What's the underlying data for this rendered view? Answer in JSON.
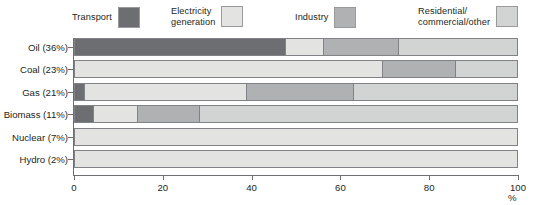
{
  "legend": {
    "items": [
      {
        "label": "Transport",
        "key": "transport",
        "color": "#6d6e71"
      },
      {
        "label": "Electricity\ngeneration",
        "key": "electricity",
        "color": "#e3e3e2"
      },
      {
        "label": "Industry",
        "key": "industry",
        "color": "#b0b1b2"
      },
      {
        "label": "Residential/\ncommercial/other",
        "key": "residential",
        "color": "#d2d3d3"
      }
    ]
  },
  "axis": {
    "x_ticks": [
      "0",
      "20",
      "40",
      "60",
      "80",
      "100"
    ],
    "x_unit": "%",
    "y_categories": [
      "Oil (36%)",
      "Coal (23%)",
      "Gas (21%)",
      "Biomass (11%)",
      "Nuclear (7%)",
      "Hydro (2%)"
    ]
  },
  "chart_data": {
    "type": "bar",
    "orientation": "horizontal",
    "stacked": true,
    "title": "",
    "xlabel": "%",
    "ylabel": "",
    "xlim": [
      0,
      100
    ],
    "grid": false,
    "legend_position": "top",
    "categories": [
      "Oil (36%)",
      "Coal (23%)",
      "Gas (21%)",
      "Biomass (11%)",
      "Nuclear (7%)",
      "Hydro (2%)"
    ],
    "series": [
      {
        "name": "Transport",
        "color": "#6d6e71",
        "values": [
          47.5,
          0,
          2,
          4,
          0,
          0
        ]
      },
      {
        "name": "Electricity generation",
        "color": "#e3e3e2",
        "values": [
          8.5,
          69.5,
          36.7,
          10,
          100,
          100
        ]
      },
      {
        "name": "Industry",
        "color": "#b0b1b2",
        "values": [
          17,
          16.5,
          24.1,
          14,
          0,
          0
        ]
      },
      {
        "name": "Residential/commercial/other",
        "color": "#d2d3d3",
        "values": [
          27,
          14,
          37.2,
          72,
          0,
          0
        ]
      }
    ],
    "rows": [
      {
        "category": "Oil (36%)",
        "segments": [
          {
            "series": "Transport",
            "value": 47.5,
            "color": "#6d6e71"
          },
          {
            "series": "Electricity generation",
            "value": 8.5,
            "color": "#e3e3e2"
          },
          {
            "series": "Industry",
            "value": 17,
            "color": "#b0b1b2"
          },
          {
            "series": "Residential/commercial/other",
            "value": 27,
            "color": "#d2d3d3"
          }
        ]
      },
      {
        "category": "Coal (23%)",
        "segments": [
          {
            "series": "Electricity generation",
            "value": 69.5,
            "color": "#e3e3e2"
          },
          {
            "series": "Industry",
            "value": 16.5,
            "color": "#b0b1b2"
          },
          {
            "series": "Residential/commercial/other",
            "value": 14,
            "color": "#d2d3d3"
          }
        ]
      },
      {
        "category": "Gas (21%)",
        "segments": [
          {
            "series": "Transport",
            "value": 2,
            "color": "#6d6e71"
          },
          {
            "series": "Electricity generation",
            "value": 36.7,
            "color": "#e3e3e2"
          },
          {
            "series": "Industry",
            "value": 24.1,
            "color": "#b0b1b2"
          },
          {
            "series": "Residential/commercial/other",
            "value": 37.2,
            "color": "#d2d3d3"
          }
        ]
      },
      {
        "category": "Biomass (11%)",
        "segments": [
          {
            "series": "Transport",
            "value": 4,
            "color": "#6d6e71"
          },
          {
            "series": "Electricity generation",
            "value": 10,
            "color": "#e3e3e2"
          },
          {
            "series": "Industry",
            "value": 14,
            "color": "#b0b1b2"
          },
          {
            "series": "Residential/commercial/other",
            "value": 72,
            "color": "#d2d3d3"
          }
        ]
      },
      {
        "category": "Nuclear (7%)",
        "segments": [
          {
            "series": "Electricity generation",
            "value": 100,
            "color": "#e3e3e2"
          }
        ]
      },
      {
        "category": "Hydro (2%)",
        "segments": [
          {
            "series": "Electricity generation",
            "value": 100,
            "color": "#e3e3e2"
          }
        ]
      }
    ]
  }
}
